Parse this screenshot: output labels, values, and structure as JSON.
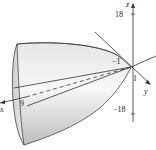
{
  "figure": {
    "axes": {
      "x_label": "x",
      "y_label": "y",
      "z_label": "z"
    },
    "ticks": {
      "z_top": "18",
      "z_bottom": "−18",
      "y_neg": "−1",
      "y_pos": "1",
      "x_end": "9"
    },
    "colors": {
      "surface_light": "#f4f4f4",
      "surface_dark": "#b8b8b8",
      "line": "#333333"
    }
  }
}
